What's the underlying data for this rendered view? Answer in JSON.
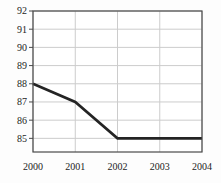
{
  "chart_data": {
    "type": "line",
    "title": "",
    "xlabel": "",
    "ylabel": "",
    "x": [
      2000,
      2001,
      2002,
      2003,
      2004
    ],
    "values": [
      88,
      87,
      85,
      85,
      85
    ],
    "series": [
      {
        "name": "value",
        "values": [
          88,
          87,
          85,
          85,
          85
        ]
      }
    ],
    "x_ticks": [
      "2000",
      "2001",
      "2002",
      "2003",
      "2004"
    ],
    "y_ticks": [
      "85",
      "86",
      "87",
      "88",
      "89",
      "90",
      "91",
      "92"
    ],
    "y_tick_values": [
      85,
      86,
      87,
      88,
      89,
      90,
      91,
      92
    ],
    "xlim": [
      2000,
      2004
    ],
    "ylim": [
      84.25,
      92
    ],
    "grid": true,
    "legend": false
  },
  "style": {
    "background_color": "#fdfdfd",
    "plot_background_color": "#ffffff",
    "border_color": "#4a4a4a",
    "grid_color": "#cccccc",
    "line_color": "#242424",
    "text_color": "#1c1c1c"
  },
  "layout": {
    "plot_left": 33,
    "plot_top": 11,
    "plot_right": 202,
    "plot_bottom": 152,
    "tick_length": 4,
    "line_width": 2.6,
    "tick_font_size": 10
  }
}
